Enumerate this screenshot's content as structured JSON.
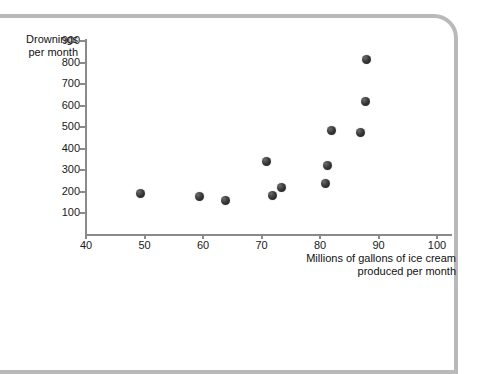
{
  "figure": {
    "y_axis_title_line1": "Drownings",
    "y_axis_title_line2": "per month",
    "x_axis_title_line1": "Millions of gallons of ice cream",
    "x_axis_title_line2": "produced per month",
    "axis_color": "#8a8a8a",
    "dot_color": "#1e1e1e",
    "frame_color": "#b9b9b9"
  },
  "chart_data": {
    "type": "scatter",
    "title": "",
    "xlabel": "Millions of gallons of ice cream produced per month",
    "ylabel": "Drownings per month",
    "xlim": [
      40,
      100
    ],
    "ylim": [
      0,
      900
    ],
    "xticks": [
      40,
      50,
      60,
      70,
      80,
      90,
      100
    ],
    "yticks": [
      100,
      200,
      300,
      400,
      500,
      600,
      700,
      800,
      900
    ],
    "xtick_labels": [
      "40",
      "50",
      "60",
      "70",
      "80",
      "90",
      "100"
    ],
    "ytick_labels": [
      "100",
      "200",
      "300",
      "400",
      "500",
      "600",
      "700",
      "800",
      "900"
    ],
    "grid": false,
    "legend": null,
    "points": [
      {
        "x": 49.3,
        "y": 190
      },
      {
        "x": 59.4,
        "y": 175
      },
      {
        "x": 63.9,
        "y": 158
      },
      {
        "x": 70.9,
        "y": 338
      },
      {
        "x": 71.8,
        "y": 182
      },
      {
        "x": 73.4,
        "y": 220
      },
      {
        "x": 81.0,
        "y": 235
      },
      {
        "x": 81.3,
        "y": 322
      },
      {
        "x": 81.9,
        "y": 485
      },
      {
        "x": 86.9,
        "y": 475
      },
      {
        "x": 87.8,
        "y": 618
      },
      {
        "x": 87.9,
        "y": 815
      }
    ]
  }
}
